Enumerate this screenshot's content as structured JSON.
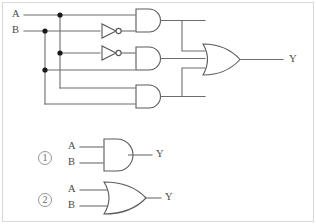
{
  "diagram": {
    "colors": {
      "wire": "#6d6d6d",
      "gate_outline": "#5a5a5a",
      "junction": "#1a1a1a",
      "frame": "#d8d8d8",
      "background": "#ffffff",
      "text": "#4a4a4a"
    },
    "inputs": [
      {
        "id": "in-a",
        "label": "A"
      },
      {
        "id": "in-b",
        "label": "B"
      }
    ],
    "outputs": [
      {
        "id": "out-y",
        "label": "Y"
      }
    ],
    "gates": [
      {
        "id": "not-1",
        "type": "not",
        "inputs": [
          "B"
        ],
        "row": 1
      },
      {
        "id": "not-2",
        "type": "not",
        "inputs": [
          "A"
        ],
        "row": 2
      },
      {
        "id": "and-1",
        "type": "and",
        "inputs": [
          "A",
          "not-1"
        ],
        "row": 1
      },
      {
        "id": "and-2",
        "type": "and",
        "inputs": [
          "not-2",
          "B"
        ],
        "row": 2
      },
      {
        "id": "and-3",
        "type": "and",
        "inputs": [
          "A",
          "B"
        ],
        "row": 3
      },
      {
        "id": "or-1",
        "type": "or",
        "inputs": [
          "and-1",
          "and-2",
          "and-3"
        ],
        "row": 2
      }
    ]
  },
  "legend": {
    "items": [
      {
        "marker": "1",
        "gate_type": "and",
        "inputs": [
          {
            "label": "A"
          },
          {
            "label": "B"
          }
        ],
        "output": {
          "label": "Y"
        }
      },
      {
        "marker": "2",
        "gate_type": "or",
        "inputs": [
          {
            "label": "A"
          },
          {
            "label": "B"
          }
        ],
        "output": {
          "label": "Y"
        }
      }
    ]
  }
}
